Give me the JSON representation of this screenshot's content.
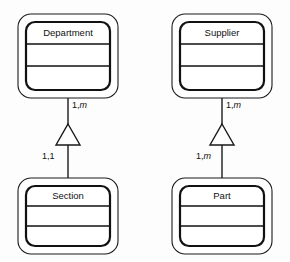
{
  "diagram": {
    "type": "uml-class-diagram",
    "background_color": "#fdfdfd",
    "line_color": "#1a1a1a",
    "fill_color": "#ffffff",
    "entities": [
      {
        "id": "department",
        "name": "Department",
        "compartments": 3,
        "x": 18,
        "y": 14,
        "width": 100,
        "height": 84
      },
      {
        "id": "section",
        "name": "Section",
        "compartments": 3,
        "x": 18,
        "y": 178,
        "width": 100,
        "height": 76
      },
      {
        "id": "supplier",
        "name": "Supplier",
        "compartments": 3,
        "x": 172,
        "y": 14,
        "width": 100,
        "height": 84
      },
      {
        "id": "part",
        "name": "Part",
        "compartments": 3,
        "x": 172,
        "y": 178,
        "width": 100,
        "height": 76
      }
    ],
    "relationships": [
      {
        "id": "department-section",
        "kind": "generalization",
        "from": "section",
        "to": "department",
        "upper_label": "1,m",
        "upper_label_plain": "1,",
        "upper_label_italic": "m",
        "lower_label": "1,1",
        "lower_label_plain": "1,1",
        "lower_label_italic": "",
        "x": 68
      },
      {
        "id": "supplier-part",
        "kind": "generalization",
        "from": "part",
        "to": "supplier",
        "upper_label": "1,m",
        "upper_label_plain": "1,",
        "upper_label_italic": "m",
        "lower_label": "1,m",
        "lower_label_plain": "1,",
        "lower_label_italic": "m",
        "x": 222
      }
    ]
  }
}
